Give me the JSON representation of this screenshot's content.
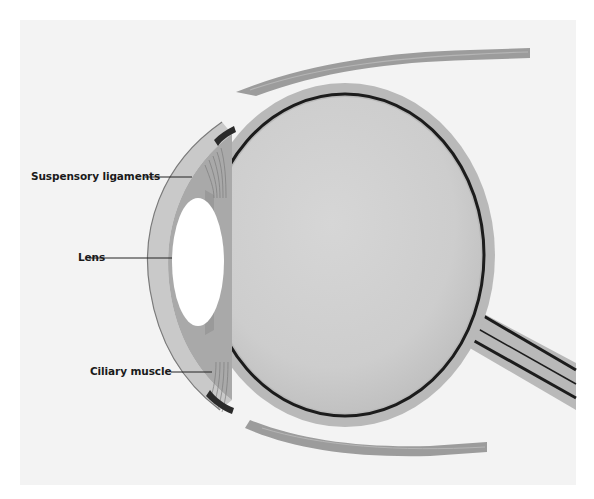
{
  "diagram": {
    "labels": [
      {
        "id": "suspensory-ligaments",
        "text": "Suspensory ligaments"
      },
      {
        "id": "lens",
        "text": "Lens"
      },
      {
        "id": "ciliary-muscle",
        "text": "Ciliary muscle"
      }
    ],
    "colors": {
      "background": "#f3f3f3",
      "sclera": "#b9b9b9",
      "choroid": "#1c1c1c",
      "vitreous": "#cfcfcf",
      "lens": "#ffffff",
      "cornea_chamber": "#a9a9a9",
      "muscle": "#9a9a9a",
      "label_text": "#1a1a1a"
    }
  }
}
